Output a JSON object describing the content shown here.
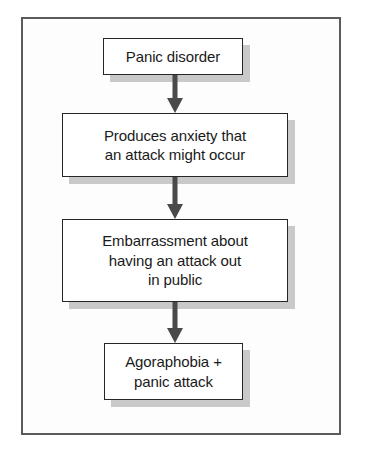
{
  "figure": {
    "type": "flowchart",
    "orientation": "top-to-bottom",
    "border_color": "#5b5b5b",
    "background_color": "#fdfdfd",
    "node_border_color": "#262626",
    "node_fill_color": "#ffffff",
    "shadow_color": "#c9c9c9",
    "arrow_color": "#4a4a4a",
    "text_color": "#1a1a1a"
  },
  "nodes": [
    {
      "id": "panic-disorder",
      "label": "Panic disorder"
    },
    {
      "id": "produces-anxiety",
      "label": "Produces anxiety that\nan attack might occur"
    },
    {
      "id": "embarrassment",
      "label": "Embarrassment about\nhaving an attack out\nin public"
    },
    {
      "id": "agoraphobia",
      "label": "Agoraphobia +\npanic attack"
    }
  ],
  "arrows": [
    {
      "id": "arrow-1",
      "from": "panic-disorder",
      "to": "produces-anxiety",
      "glyph": "down-arrow"
    },
    {
      "id": "arrow-2",
      "from": "produces-anxiety",
      "to": "embarrassment",
      "glyph": "down-arrow"
    },
    {
      "id": "arrow-3",
      "from": "embarrassment",
      "to": "agoraphobia",
      "glyph": "down-arrow"
    }
  ]
}
